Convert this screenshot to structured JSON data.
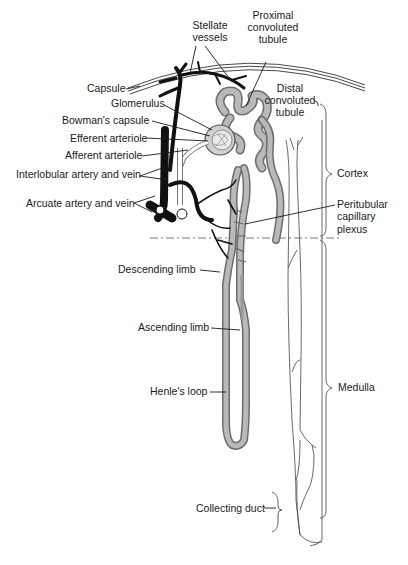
{
  "figure": {
    "labels": {
      "stellate_vessels": [
        "Stellate",
        "vessels"
      ],
      "proximal_tubule": [
        "Proximal",
        "convoluted",
        "tubule"
      ],
      "capsule": "Capsule",
      "distal_tubule": [
        "Distal",
        "convoluted",
        "tubule"
      ],
      "glomerulus": "Glomerulus",
      "bowmans_capsule": "Bowman's capsule",
      "efferent_arteriole": "Efferent arteriole",
      "afferent_arteriole": "Afferent arteriole",
      "interlobular": "Interlobular artery and vein",
      "arcuate": "Arcuate artery and vein",
      "cortex": "Cortex",
      "peritubular": [
        "Peritubular",
        "capillary",
        "plexus"
      ],
      "descending_limb": "Descending limb",
      "ascending_limb": "Ascending limb",
      "henles_loop": "Henle's loop",
      "medulla": "Medulla",
      "collecting_duct": "Collecting duct"
    },
    "colors": {
      "ink": "#1a1a1a",
      "tubule": "#8a8a8a",
      "vessel": "#111111",
      "background": "#ffffff"
    }
  }
}
